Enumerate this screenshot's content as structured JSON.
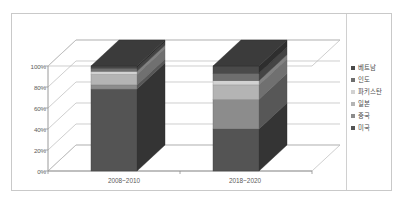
{
  "chart_data": {
    "type": "bar",
    "subtype": "stacked-100-percent-3d-column",
    "title": "",
    "xlabel": "",
    "ylabel": "",
    "categories": [
      "2008~2010",
      "2018~2020"
    ],
    "ylim": [
      0,
      100
    ],
    "ytick_labels": [
      "0%",
      "20%",
      "40%",
      "60%",
      "80%",
      "100%"
    ],
    "ytick_values": [
      0,
      20,
      40,
      60,
      80,
      100
    ],
    "grid": true,
    "legend_position": "right",
    "series": [
      {
        "name": "미국",
        "color": "#545454",
        "values": [
          78,
          40
        ]
      },
      {
        "name": "중국",
        "color": "#8c8c8c",
        "values": [
          4,
          28
        ]
      },
      {
        "name": "일본",
        "color": "#b4b4b4",
        "values": [
          10,
          14
        ]
      },
      {
        "name": "파키스탄",
        "color": "#d2d2d2",
        "values": [
          3,
          4
        ]
      },
      {
        "name": "인도",
        "color": "#6e6e6e",
        "values": [
          3,
          7
        ]
      },
      {
        "name": "베트남",
        "color": "#4a4a4a",
        "values": [
          2,
          7
        ]
      }
    ],
    "legend_entries": [
      "베트남",
      "인도",
      "파키스탄",
      "일본",
      "중국",
      "미국"
    ]
  },
  "colors": {
    "frame_border": "#c9c9c9",
    "gridline": "#b9b9b9",
    "axis_line": "#8f8f8f",
    "tick_text": "#5a5a5a",
    "legend_text": "#4a4a4a",
    "background": "#ffffff",
    "side_shade": "#3f3f3f",
    "top_shade": "#6a6a6a"
  }
}
